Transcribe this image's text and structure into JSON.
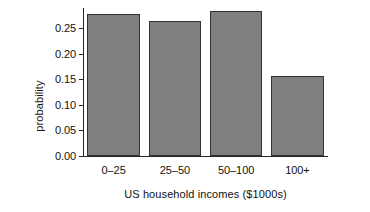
{
  "chart_data": {
    "type": "bar",
    "title": "",
    "xlabel": "US household incomes ($1000s)",
    "ylabel": "probability",
    "categories": [
      "0–25",
      "25–50",
      "50–100",
      "100+"
    ],
    "values": [
      0.278,
      0.264,
      0.283,
      0.157
    ],
    "ytick_labels": [
      "0.00",
      "0.05",
      "0.10",
      "0.15",
      "0.20",
      "0.25"
    ],
    "ytick_values": [
      0.0,
      0.05,
      0.1,
      0.15,
      0.2,
      0.25
    ],
    "ylim": [
      0.0,
      0.289
    ],
    "xlim_note": "categorical",
    "grid": false,
    "legend": false,
    "bar_color": "#7f7f7f",
    "bar_edge_color": "#333333",
    "axis_color": "#262626",
    "background": "#ffffff"
  }
}
